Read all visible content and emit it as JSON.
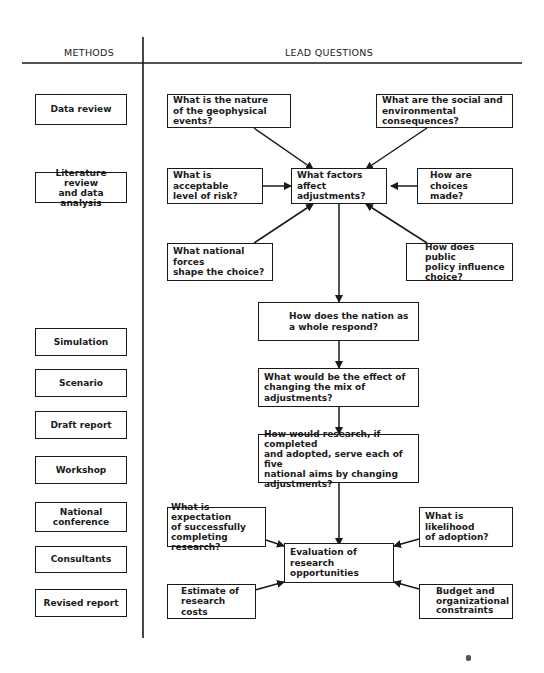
{
  "headers": {
    "methods": "METHODS",
    "lead_questions": "LEAD QUESTIONS"
  },
  "methods": [
    {
      "label": "Data review"
    },
    {
      "label": "Literature review\nand data analysis"
    },
    {
      "label": "Simulation"
    },
    {
      "label": "Scenario"
    },
    {
      "label": "Draft report"
    },
    {
      "label": "Workshop"
    },
    {
      "label": "National conference"
    },
    {
      "label": "Consultants"
    },
    {
      "label": "Revised report"
    }
  ],
  "questions": {
    "geophysical": "What is the nature\nof the geophysical events?",
    "consequences": "What are the social and\nenvironmental consequences?",
    "acceptable_risk": "What is acceptable\nlevel of risk?",
    "factors": "What factors affect\nadjustments?",
    "choices_made": "How are choices\nmade?",
    "national_forces": "What national forces\nshape the choice?",
    "public_policy": "How does public\npolicy influence\nchoice?",
    "nation_respond": "How does the nation as\na whole respond?",
    "mix_effect": "What would be the effect of\nchanging the mix of adjustments?",
    "research_serve": "How would research, if completed\nand adopted, serve each of five\nnational aims by changing\nadjustments?",
    "expectation": "What is expectation\nof successfully\ncompleting research?",
    "likelihood": "What is likelihood\nof adoption?",
    "evaluation": "Evaluation of research\nopportunities",
    "costs": "Estimate of\nresearch costs",
    "budget": "Budget and\norganizational\nconstraints"
  }
}
